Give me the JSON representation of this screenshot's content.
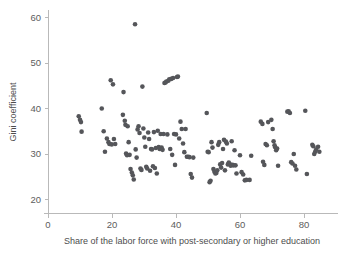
{
  "chart_data": {
    "type": "scatter",
    "title": "",
    "subtitle": "",
    "xlabel": "Share of the labor force with post-secondary or higher education",
    "ylabel": "Gini coefficient",
    "xlim": [
      0,
      88
    ],
    "ylim": [
      17,
      62
    ],
    "xticks": [
      0,
      20,
      40,
      60,
      80
    ],
    "yticks": [
      20,
      30,
      40,
      50,
      60
    ],
    "xtick_labels": [
      "0",
      "20",
      "40",
      "60",
      "80"
    ],
    "ytick_labels": [
      "20",
      "30",
      "40",
      "50",
      "60"
    ],
    "grid": false,
    "legend": null,
    "legend_position": "none",
    "marker_color": "#55565a",
    "axis_color": "#b9b9b9",
    "background_color": "#ffffff",
    "marker_size": 2.3,
    "n_points": 157,
    "annotations": [],
    "points": [
      [
        9.6,
        38.2
      ],
      [
        10.0,
        37.4
      ],
      [
        10.3,
        36.9
      ],
      [
        10.5,
        34.8
      ],
      [
        16.8,
        39.9
      ],
      [
        17.4,
        34.9
      ],
      [
        17.8,
        30.4
      ],
      [
        18.4,
        33.3
      ],
      [
        18.9,
        32.5
      ],
      [
        19.2,
        32.1
      ],
      [
        19.6,
        46.1
      ],
      [
        19.9,
        32.0
      ],
      [
        20.3,
        45.2
      ],
      [
        20.6,
        33.2
      ],
      [
        21.0,
        32.1
      ],
      [
        23.4,
        38.5
      ],
      [
        23.6,
        43.5
      ],
      [
        24.0,
        37.2
      ],
      [
        24.2,
        36.3
      ],
      [
        24.4,
        30.0
      ],
      [
        24.7,
        29.6
      ],
      [
        24.9,
        36.0
      ],
      [
        25.2,
        32.5
      ],
      [
        25.5,
        29.7
      ],
      [
        25.8,
        26.6
      ],
      [
        26.2,
        25.8
      ],
      [
        26.5,
        25.2
      ],
      [
        26.8,
        24.3
      ],
      [
        27.2,
        58.4
      ],
      [
        27.4,
        30.9
      ],
      [
        27.7,
        29.1
      ],
      [
        28.0,
        35.3
      ],
      [
        28.3,
        36.0
      ],
      [
        28.6,
        34.5
      ],
      [
        28.9,
        26.7
      ],
      [
        29.2,
        26.4
      ],
      [
        29.5,
        44.7
      ],
      [
        29.8,
        35.5
      ],
      [
        30.1,
        33.5
      ],
      [
        30.4,
        31.5
      ],
      [
        30.7,
        27.1
      ],
      [
        31.0,
        26.7
      ],
      [
        31.3,
        34.6
      ],
      [
        31.6,
        33.2
      ],
      [
        31.9,
        26.2
      ],
      [
        32.2,
        31.0
      ],
      [
        32.5,
        30.9
      ],
      [
        32.8,
        27.2
      ],
      [
        33.1,
        34.7
      ],
      [
        33.4,
        26.8
      ],
      [
        33.7,
        31.2
      ],
      [
        34.0,
        25.6
      ],
      [
        34.3,
        35.0
      ],
      [
        34.6,
        31.4
      ],
      [
        34.9,
        31.0
      ],
      [
        35.2,
        34.3
      ],
      [
        35.5,
        31.3
      ],
      [
        35.8,
        30.8
      ],
      [
        36.1,
        34.3
      ],
      [
        36.4,
        45.5
      ],
      [
        36.7,
        45.6
      ],
      [
        37.0,
        45.8
      ],
      [
        37.3,
        34.2
      ],
      [
        37.6,
        46.0
      ],
      [
        37.9,
        46.3
      ],
      [
        38.2,
        31.0
      ],
      [
        38.5,
        46.4
      ],
      [
        38.8,
        29.7
      ],
      [
        39.1,
        46.6
      ],
      [
        39.4,
        34.3
      ],
      [
        39.7,
        27.5
      ],
      [
        40.0,
        34.2
      ],
      [
        40.3,
        46.8
      ],
      [
        40.6,
        46.9
      ],
      [
        41.0,
        33.3
      ],
      [
        41.4,
        37.0
      ],
      [
        41.8,
        35.4
      ],
      [
        42.2,
        32.2
      ],
      [
        42.6,
        30.3
      ],
      [
        43.0,
        35.4
      ],
      [
        43.4,
        29.3
      ],
      [
        43.8,
        29.3
      ],
      [
        44.2,
        29.2
      ],
      [
        44.6,
        25.5
      ],
      [
        45.0,
        24.7
      ],
      [
        45.4,
        29.1
      ],
      [
        49.6,
        38.9
      ],
      [
        49.9,
        30.4
      ],
      [
        50.2,
        30.3
      ],
      [
        50.5,
        23.7
      ],
      [
        50.8,
        24.0
      ],
      [
        51.1,
        32.5
      ],
      [
        51.4,
        31.3
      ],
      [
        51.7,
        26.6
      ],
      [
        52.0,
        26.0
      ],
      [
        52.3,
        25.6
      ],
      [
        52.6,
        25.7
      ],
      [
        52.9,
        26.3
      ],
      [
        53.2,
        31.9
      ],
      [
        53.5,
        32.5
      ],
      [
        53.8,
        27.6
      ],
      [
        54.1,
        26.9
      ],
      [
        54.4,
        27.9
      ],
      [
        54.7,
        31.0
      ],
      [
        55.0,
        33.0
      ],
      [
        55.3,
        26.3
      ],
      [
        55.6,
        32.6
      ],
      [
        55.9,
        32.2
      ],
      [
        56.2,
        27.6
      ],
      [
        56.5,
        28.0
      ],
      [
        56.8,
        27.7
      ],
      [
        57.1,
        27.3
      ],
      [
        57.4,
        32.7
      ],
      [
        57.7,
        27.5
      ],
      [
        58.0,
        27.4
      ],
      [
        58.3,
        30.7
      ],
      [
        58.6,
        27.4
      ],
      [
        58.9,
        25.6
      ],
      [
        60.0,
        29.6
      ],
      [
        60.5,
        25.9
      ],
      [
        61.0,
        25.4
      ],
      [
        61.5,
        24.1
      ],
      [
        62.0,
        24.2
      ],
      [
        63.0,
        24.2
      ],
      [
        63.5,
        29.5
      ],
      [
        66.5,
        37.0
      ],
      [
        67.0,
        36.5
      ],
      [
        67.2,
        28.2
      ],
      [
        67.6,
        27.5
      ],
      [
        68.0,
        32.1
      ],
      [
        68.4,
        31.8
      ],
      [
        68.8,
        36.9
      ],
      [
        69.8,
        37.4
      ],
      [
        70.2,
        35.4
      ],
      [
        70.5,
        32.7
      ],
      [
        70.8,
        31.8
      ],
      [
        71.0,
        31.4
      ],
      [
        71.3,
        30.7
      ],
      [
        71.6,
        31.1
      ],
      [
        71.9,
        27.3
      ],
      [
        74.8,
        39.2
      ],
      [
        75.2,
        39.3
      ],
      [
        75.6,
        38.9
      ],
      [
        76.0,
        28.1
      ],
      [
        76.4,
        27.8
      ],
      [
        76.8,
        29.9
      ],
      [
        77.2,
        27.3
      ],
      [
        77.6,
        26.5
      ],
      [
        80.4,
        39.4
      ],
      [
        80.9,
        25.5
      ],
      [
        82.6,
        31.9
      ],
      [
        82.9,
        31.6
      ],
      [
        83.2,
        29.9
      ],
      [
        83.5,
        30.4
      ],
      [
        83.8,
        30.9
      ],
      [
        84.4,
        31.5
      ],
      [
        84.8,
        30.4
      ]
    ]
  }
}
